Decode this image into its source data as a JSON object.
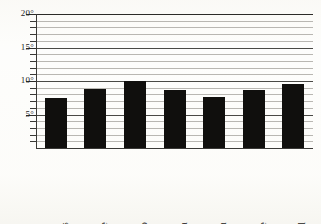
{
  "chart_data": {
    "type": "bar",
    "title": "",
    "subtitle": "",
    "xlabel": "",
    "ylabel": "",
    "categories": [
      "St Andrews",
      "Larne",
      "Sligo",
      "Swansea",
      "Harwich",
      "Eastbourne",
      "St Austell"
    ],
    "values": [
      7.5,
      8.8,
      10.0,
      8.7,
      7.6,
      8.7,
      9.5
    ],
    "unit": "°",
    "ylim": [
      0,
      20
    ],
    "y_major_ticks": [
      5,
      10,
      15,
      20
    ],
    "y_tick_labels": [
      "5°",
      "10°",
      "15°",
      "20°"
    ],
    "y_minor_tick_interval": 1,
    "grid": "horizontal",
    "legend": "none",
    "bar_color": "#100f0d",
    "gridline_color": "#b9b7b2",
    "major_gridline_color": "#4a4945",
    "axis_color": "#3a3936",
    "background_color": "#fdfdfb"
  }
}
